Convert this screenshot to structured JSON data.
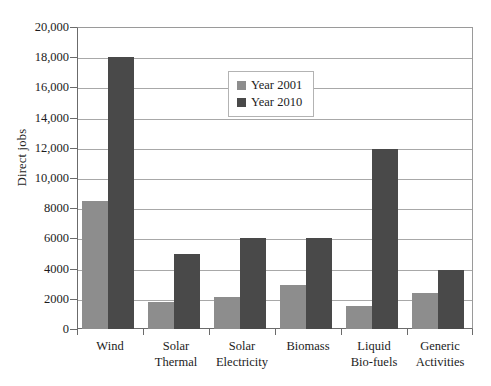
{
  "chart_data": {
    "type": "bar",
    "title": "",
    "xlabel": "",
    "ylabel": "Direct jobs",
    "ylim": [
      0,
      20000
    ],
    "ytick_step": 2000,
    "ytick_labels": [
      "0",
      "2000",
      "4000",
      "6000",
      "8000",
      "10,000",
      "12,000",
      "14,000",
      "16,000",
      "18,000",
      "20,000"
    ],
    "yticks": [
      0,
      2000,
      4000,
      6000,
      8000,
      10000,
      12000,
      14000,
      16000,
      18000,
      20000
    ],
    "grid": true,
    "legend_position": "upper-center",
    "categories": [
      "Wind",
      "Solar Thermal",
      "Solar Electricity",
      "Biomass",
      "Liquid Bio-fuels",
      "Generic Activities"
    ],
    "category_lines": [
      [
        "Wind"
      ],
      [
        "Solar",
        "Thermal"
      ],
      [
        "Solar",
        "Electricity"
      ],
      [
        "Biomass"
      ],
      [
        "Liquid",
        "Bio-fuels"
      ],
      [
        "Generic",
        "Activities"
      ]
    ],
    "series": [
      {
        "name": "Year 2001",
        "color": "#8d8d8d",
        "values": [
          8500,
          1800,
          2100,
          2900,
          1500,
          2400
        ]
      },
      {
        "name": "Year 2010",
        "color": "#494949",
        "values": [
          18000,
          5000,
          6000,
          6000,
          11900,
          3900
        ]
      }
    ]
  },
  "legend": {
    "items": [
      {
        "label": "Year 2001",
        "color": "#8d8d8d"
      },
      {
        "label": "Year 2010",
        "color": "#494949"
      }
    ]
  }
}
